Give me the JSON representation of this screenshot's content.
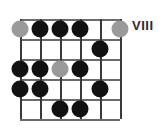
{
  "diagram": {
    "type": "guitar-fretboard-diagram",
    "position_label": "VIII",
    "strings": 6,
    "frets": 5,
    "colors": {
      "dot_black": "#111111",
      "dot_gray": "#9a9a9a",
      "fret_line": "#6b6b6b",
      "string_line": "#3a3a3a",
      "background": "#ffffff",
      "label_text": "#2b2b2b"
    },
    "dots": [
      {
        "string": 1,
        "fret": 1,
        "color": "gray",
        "name": "dot-s1-f1"
      },
      {
        "string": 2,
        "fret": 1,
        "color": "black",
        "name": "dot-s2-f1"
      },
      {
        "string": 3,
        "fret": 1,
        "color": "black",
        "name": "dot-s3-f1"
      },
      {
        "string": 4,
        "fret": 1,
        "color": "black",
        "name": "dot-s4-f1"
      },
      {
        "string": 6,
        "fret": 1,
        "color": "gray",
        "name": "dot-s6-f1"
      },
      {
        "string": 5,
        "fret": 2,
        "color": "black",
        "name": "dot-s5-f2"
      },
      {
        "string": 1,
        "fret": 3,
        "color": "black",
        "name": "dot-s1-f3"
      },
      {
        "string": 2,
        "fret": 3,
        "color": "black",
        "name": "dot-s2-f3"
      },
      {
        "string": 3,
        "fret": 3,
        "color": "gray",
        "name": "dot-s3-f3"
      },
      {
        "string": 4,
        "fret": 3,
        "color": "black",
        "name": "dot-s4-f3"
      },
      {
        "string": 1,
        "fret": 4,
        "color": "black",
        "name": "dot-s1-f4"
      },
      {
        "string": 2,
        "fret": 4,
        "color": "black",
        "name": "dot-s2-f4"
      },
      {
        "string": 5,
        "fret": 4,
        "color": "black",
        "name": "dot-s5-f4"
      },
      {
        "string": 3,
        "fret": 5,
        "color": "black",
        "name": "dot-s3-f5"
      },
      {
        "string": 4,
        "fret": 5,
        "color": "black",
        "name": "dot-s4-f5"
      }
    ]
  }
}
